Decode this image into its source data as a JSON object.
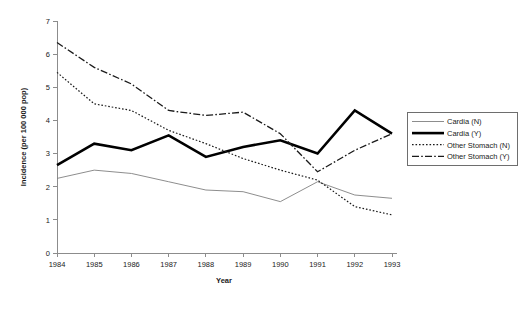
{
  "chart_data": {
    "type": "line",
    "title": "",
    "xlabel": "Year",
    "ylabel": "Incidence (per 100 000 pop)",
    "categories": [
      "1984",
      "1985",
      "1986",
      "1987",
      "1988",
      "1989",
      "1990",
      "1991",
      "1992",
      "1993"
    ],
    "x": [
      1984,
      1985,
      1986,
      1987,
      1988,
      1989,
      1990,
      1991,
      1992,
      1993
    ],
    "xlim": [
      1984,
      1993
    ],
    "ylim": [
      0,
      7
    ],
    "yticks": [
      "0",
      "1",
      "2",
      "3",
      "4",
      "5",
      "6",
      "7"
    ],
    "grid": false,
    "legend_position": "right",
    "series": [
      {
        "name": "Cardia (N)",
        "style": "solid-thin",
        "color": "#808080",
        "values": [
          2.25,
          2.5,
          2.4,
          2.15,
          1.9,
          1.85,
          1.55,
          2.15,
          1.75,
          1.65
        ]
      },
      {
        "name": "Cardia (Y)",
        "style": "solid-thick",
        "color": "#000000",
        "values": [
          2.65,
          3.3,
          3.1,
          3.55,
          2.9,
          3.2,
          3.4,
          3.0,
          4.3,
          3.6
        ]
      },
      {
        "name": "Other Stomach (N)",
        "style": "dotted",
        "color": "#1a1a1a",
        "values": [
          5.45,
          4.5,
          4.3,
          3.7,
          3.3,
          2.85,
          2.5,
          2.2,
          1.4,
          1.15
        ]
      },
      {
        "name": "Other Stomach (Y)",
        "style": "dash-dot",
        "color": "#1a1a1a",
        "values": [
          6.35,
          5.6,
          5.1,
          4.3,
          4.15,
          4.25,
          3.6,
          2.45,
          3.1,
          3.6
        ]
      }
    ]
  },
  "legend": {
    "items": [
      {
        "label": "Cardia (N)"
      },
      {
        "label": "Cardia (Y)"
      },
      {
        "label": "Other Stomach (N)"
      },
      {
        "label": "Other Stomach (Y)"
      }
    ]
  }
}
